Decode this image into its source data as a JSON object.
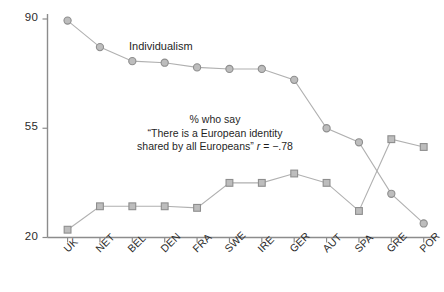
{
  "chart_data": {
    "type": "line",
    "title": "",
    "xlabel": "",
    "ylabel": "",
    "ylim": [
      20,
      90
    ],
    "yticks": [
      90,
      55,
      20
    ],
    "grid": false,
    "legend_position": "inline-annotation",
    "categories": [
      "UK",
      "NET",
      "BEL",
      "DEN",
      "FRA",
      "SWE",
      "IRE",
      "GER",
      "AUT",
      "SPA",
      "GRE",
      "POR"
    ],
    "series": [
      {
        "name": "Individualism",
        "marker": "circle",
        "values": [
          89.5,
          81.0,
          76.5,
          76.0,
          74.5,
          74.0,
          74.0,
          70.5,
          55.0,
          50.5,
          34.0,
          24.5
        ]
      },
      {
        "name": "% who say \"There is a European identity shared by all Europeans\"",
        "marker": "square",
        "values": [
          22.5,
          30.0,
          30.0,
          30.0,
          29.5,
          37.5,
          37.5,
          40.5,
          37.5,
          28.5,
          51.5,
          49.0
        ]
      }
    ],
    "annotations": [
      {
        "name": "series-label-individualism",
        "text": "Individualism"
      },
      {
        "name": "annotation-correlation",
        "line1": "% who say",
        "line2": "“There is a European identity",
        "line3_prefix": "shared by all Europeans” ",
        "line3_stat_var": "r",
        "line3_stat_rest": " = −.78"
      }
    ],
    "colors": {
      "marker_fill": "#bdbdbd",
      "marker_stroke": "#8e8e8e",
      "line": "#b0b0b0",
      "axis": "#8c8c8c",
      "text": "#1f1f1f"
    }
  }
}
